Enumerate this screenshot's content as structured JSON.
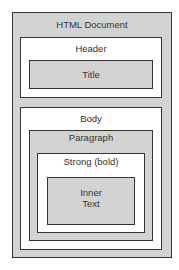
{
  "diagram": {
    "nodes": {
      "document": {
        "label": "HTML Document"
      },
      "header": {
        "label": "Header"
      },
      "title": {
        "label": "Title"
      },
      "body": {
        "label": "Body"
      },
      "paragraph": {
        "label": "Paragraph"
      },
      "strong": {
        "label": "Strong (bold)"
      },
      "inner": {
        "label_line1": "Inner",
        "label_line2": "Text"
      }
    },
    "colors": {
      "gray_fill": "#d3d3d3",
      "white_fill": "#ffffff",
      "border": "#333333"
    }
  }
}
